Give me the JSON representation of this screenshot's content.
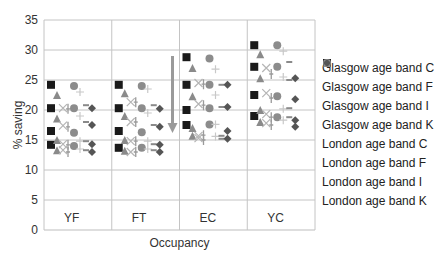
{
  "chart_data": {
    "type": "scatter",
    "title": "",
    "xlabel": "Occupancy",
    "ylabel": "% saving",
    "ylim": [
      0,
      35
    ],
    "yticks": [
      0,
      5,
      10,
      15,
      20,
      25,
      30,
      35
    ],
    "grid": true,
    "legend_position": "right",
    "categories": [
      "YF",
      "FT",
      "EC",
      "YC"
    ],
    "annotations": [
      {
        "type": "arrow",
        "direction": "down",
        "group": "EC",
        "from": 29,
        "to": 16.5
      }
    ],
    "series": [
      {
        "name": "Glasgow age band C",
        "marker": "square",
        "color": "#1a1a1a",
        "values": {
          "YF": [
            24.2,
            20.3,
            16.5,
            14.2
          ],
          "FT": [
            24.2,
            20.3,
            16.5,
            13.7
          ],
          "EC": [
            28.8,
            24.2,
            20.0,
            17.5
          ],
          "YC": [
            30.8,
            27.2,
            22.5,
            19.0
          ]
        }
      },
      {
        "name": "Glasgow age band F",
        "marker": "triangle",
        "color": "#8a8a8a",
        "values": {
          "YF": [
            22.5,
            18.6,
            15.0,
            13.3
          ],
          "FT": [
            22.8,
            19.0,
            15.0,
            13.2
          ],
          "EC": [
            27.0,
            22.3,
            17.0,
            15.7
          ],
          "YC": [
            29.3,
            25.3,
            20.0,
            18.0
          ]
        }
      },
      {
        "name": "Glasgow age band I",
        "marker": "x",
        "color": "#b5b5b5",
        "values": {
          "YF": [
            20.3,
            17.4,
            14.3,
            13.3
          ],
          "FT": [
            21.3,
            18.0,
            14.8,
            13.0
          ],
          "EC": [
            24.5,
            21.0,
            15.7,
            15.3
          ],
          "YC": [
            27.0,
            22.8,
            19.3,
            17.8
          ]
        }
      },
      {
        "name": "Glasgow age band K",
        "marker": "bar",
        "color": "#9a9a9a",
        "values": {
          "YF": [
            20.2,
            17.2,
            14.2,
            13.0
          ],
          "FT": [
            21.3,
            18.0,
            14.8,
            13.0
          ],
          "EC": [
            24.3,
            20.8,
            15.8,
            15.0
          ],
          "YC": [
            26.0,
            22.0,
            18.8,
            17.5
          ]
        }
      },
      {
        "name": "London age band C",
        "marker": "circle",
        "color": "#8c8c8c",
        "values": {
          "YF": [
            24.0,
            20.3,
            16.2,
            14.0
          ],
          "FT": [
            24.0,
            20.3,
            16.3,
            13.7
          ],
          "EC": [
            28.6,
            24.2,
            20.3,
            17.6
          ],
          "YC": [
            30.8,
            27.2,
            22.3,
            18.8
          ]
        }
      },
      {
        "name": "London age band F",
        "marker": "plus",
        "color": "#c8c8c8",
        "values": {
          "YF": [
            23.0,
            19.0,
            14.8,
            13.5
          ],
          "FT": [
            23.5,
            19.5,
            14.8,
            13.5
          ],
          "EC": [
            26.8,
            22.5,
            17.6,
            15.6
          ],
          "YC": [
            29.8,
            25.5,
            20.2,
            18.3
          ]
        }
      },
      {
        "name": "London age band I",
        "marker": "dash",
        "color": "#8a8a8a",
        "values": {
          "YF": [
            20.8,
            18.0,
            14.8,
            13.3
          ],
          "FT": [
            20.8,
            17.5,
            14.3,
            13.3
          ],
          "EC": [
            24.2,
            20.5,
            15.7,
            15.2
          ],
          "YC": [
            28.0,
            25.0,
            20.3,
            18.8
          ]
        }
      },
      {
        "name": "London age band K",
        "marker": "diamond",
        "color": "#555555",
        "values": {
          "YF": [
            20.3,
            17.5,
            14.3,
            13.0
          ],
          "FT": [
            20.2,
            17.2,
            14.2,
            13.0
          ],
          "EC": [
            24.2,
            20.5,
            16.5,
            15.2
          ],
          "YC": [
            25.3,
            21.8,
            18.3,
            17.2
          ]
        }
      }
    ]
  },
  "axis": {
    "ylabel": "% saving",
    "xlabel": "Occupancy",
    "yticks": [
      "0",
      "5",
      "10",
      "15",
      "20",
      "25",
      "30",
      "35"
    ],
    "groups": [
      "YF",
      "FT",
      "EC",
      "YC"
    ]
  },
  "legend": {
    "items": [
      {
        "label": "Glasgow age band C"
      },
      {
        "label": "Glasgow age band F"
      },
      {
        "label": "Glasgow age band I"
      },
      {
        "label": "Glasgow age band K"
      },
      {
        "label": "London age band C"
      },
      {
        "label": "London age band F"
      },
      {
        "label": "London age band I"
      },
      {
        "label": "London age band K"
      }
    ]
  }
}
